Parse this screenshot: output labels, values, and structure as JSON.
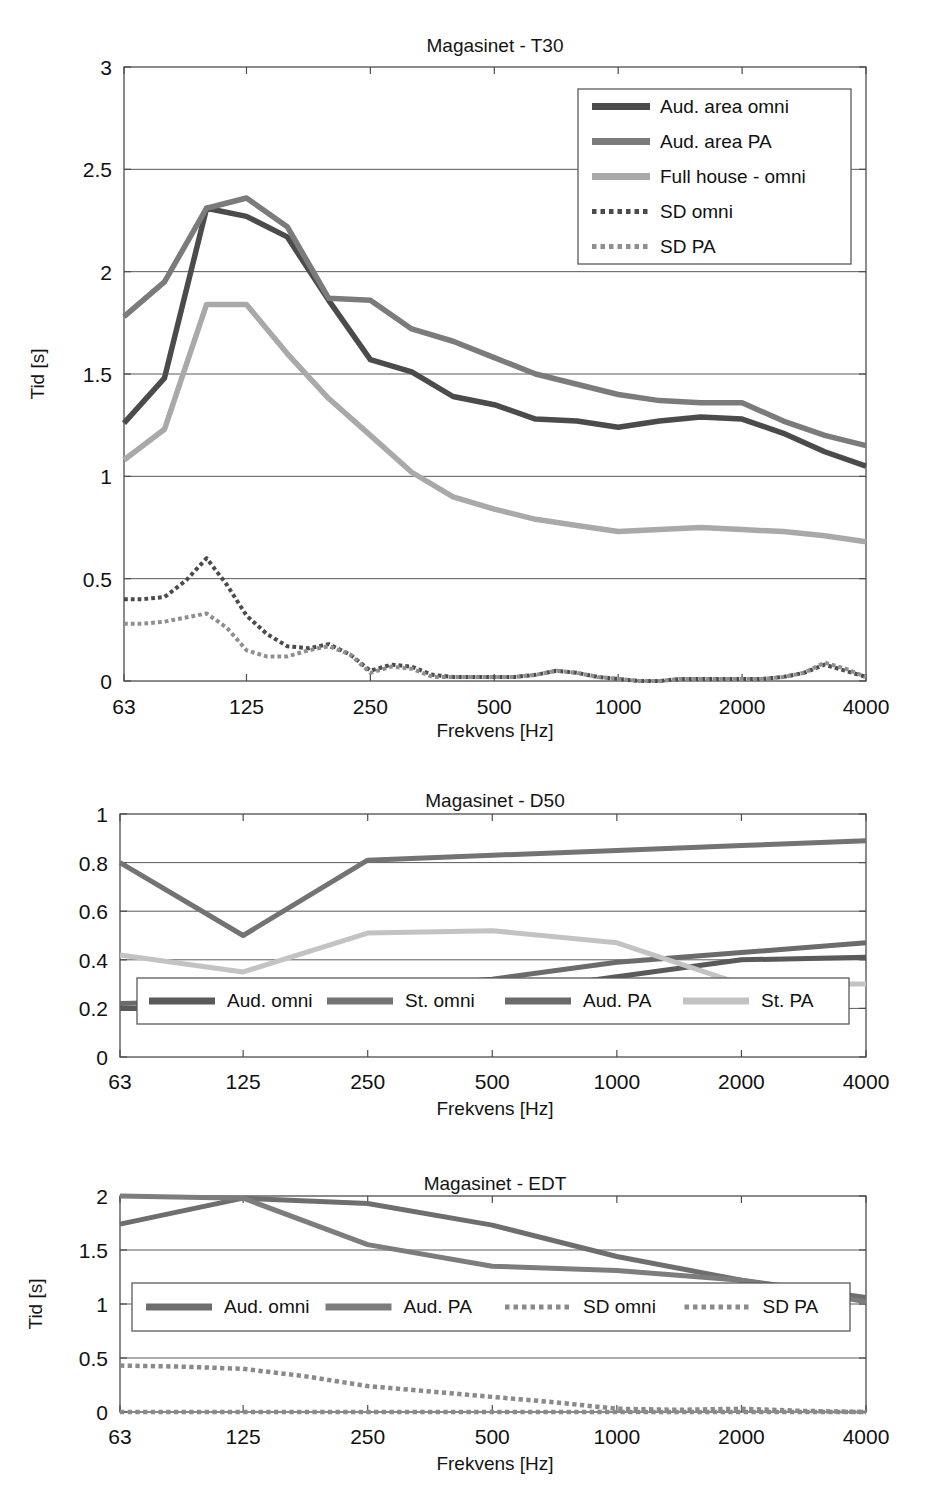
{
  "figure": {
    "x_tick_labels": [
      "63",
      "125",
      "250",
      "500",
      "1000",
      "2000",
      "4000"
    ],
    "xlabel": "Frekvens [Hz]",
    "ylabel_time": "Tid [s]"
  },
  "chart_data": [
    {
      "id": "t30",
      "type": "line",
      "title": "Magasinet - T30",
      "xlabel": "Frekvens [Hz]",
      "ylabel": "Tid [s]",
      "xscale": "log",
      "x_ticks": [
        63,
        125,
        250,
        500,
        1000,
        2000,
        4000
      ],
      "x_tick_labels": [
        "63",
        "125",
        "250",
        "500",
        "1000",
        "2000",
        "4000"
      ],
      "xlim": [
        63,
        4000
      ],
      "ylim": [
        0,
        3
      ],
      "y_ticks": [
        0,
        0.5,
        1,
        1.5,
        2,
        2.5,
        3
      ],
      "y_tick_labels": [
        "0",
        "0.5",
        "1",
        "1.5",
        "2",
        "2.5",
        "3"
      ],
      "grid": true,
      "legend_position": "top-right",
      "series": [
        {
          "name": "Aud. area omni",
          "color": "#4b4b4b",
          "style": "solid",
          "width": 5.5,
          "x": [
            63,
            79,
            100,
            125,
            157,
            198,
            250,
            315,
            397,
            500,
            630,
            794,
            1000,
            1260,
            1587,
            2000,
            2520,
            3175,
            4000
          ],
          "values": [
            1.26,
            1.48,
            2.31,
            2.27,
            2.17,
            1.86,
            1.57,
            1.51,
            1.39,
            1.35,
            1.28,
            1.27,
            1.24,
            1.27,
            1.29,
            1.28,
            1.21,
            1.12,
            1.05
          ]
        },
        {
          "name": "Aud. area PA",
          "color": "#7b7b7b",
          "style": "solid",
          "width": 5.5,
          "x": [
            63,
            79,
            100,
            125,
            157,
            198,
            250,
            315,
            397,
            500,
            630,
            794,
            1000,
            1260,
            1587,
            2000,
            2520,
            3175,
            4000
          ],
          "values": [
            1.78,
            1.95,
            2.31,
            2.36,
            2.22,
            1.87,
            1.86,
            1.72,
            1.66,
            1.58,
            1.5,
            1.45,
            1.4,
            1.37,
            1.36,
            1.36,
            1.27,
            1.2,
            1.15
          ]
        },
        {
          "name": "Full house - omni",
          "color": "#a9a9a9",
          "style": "solid",
          "width": 5.5,
          "x": [
            63,
            79,
            100,
            125,
            157,
            198,
            250,
            315,
            397,
            500,
            630,
            794,
            1000,
            1260,
            1587,
            2000,
            2520,
            3175,
            4000
          ],
          "values": [
            1.08,
            1.23,
            1.84,
            1.84,
            1.6,
            1.38,
            1.2,
            1.02,
            0.9,
            0.84,
            0.79,
            0.76,
            0.73,
            0.74,
            0.75,
            0.74,
            0.73,
            0.71,
            0.68
          ]
        },
        {
          "name": "SD omni",
          "color": "#4b4b4b",
          "style": "dotted",
          "width": 4,
          "x": [
            63,
            70,
            79,
            89,
            100,
            112,
            125,
            140,
            157,
            177,
            198,
            223,
            250,
            281,
            315,
            354,
            397,
            445,
            500,
            561,
            630,
            707,
            794,
            891,
            1000,
            1122,
            1260,
            1414,
            1587,
            1782,
            2000,
            2245,
            2520,
            2828,
            3175,
            3564,
            4000
          ],
          "values": [
            0.4,
            0.4,
            0.41,
            0.49,
            0.6,
            0.47,
            0.32,
            0.23,
            0.17,
            0.16,
            0.18,
            0.13,
            0.05,
            0.08,
            0.07,
            0.03,
            0.02,
            0.02,
            0.02,
            0.02,
            0.03,
            0.05,
            0.04,
            0.02,
            0.01,
            0.0,
            0.0,
            0.01,
            0.01,
            0.01,
            0.01,
            0.01,
            0.02,
            0.04,
            0.08,
            0.05,
            0.02
          ]
        },
        {
          "name": "SD PA",
          "color": "#8f8f8f",
          "style": "dotted",
          "width": 4,
          "x": [
            63,
            70,
            79,
            89,
            100,
            112,
            125,
            140,
            157,
            177,
            198,
            223,
            250,
            281,
            315,
            354,
            397,
            445,
            500,
            561,
            630,
            707,
            794,
            891,
            1000,
            1122,
            1260,
            1414,
            1587,
            1782,
            2000,
            2245,
            2520,
            2828,
            3175,
            3564,
            4000
          ],
          "values": [
            0.28,
            0.28,
            0.29,
            0.31,
            0.33,
            0.26,
            0.15,
            0.12,
            0.12,
            0.15,
            0.17,
            0.13,
            0.04,
            0.07,
            0.06,
            0.02,
            0.02,
            0.02,
            0.02,
            0.02,
            0.03,
            0.05,
            0.04,
            0.02,
            0.01,
            0.0,
            0.0,
            0.01,
            0.01,
            0.01,
            0.01,
            0.01,
            0.02,
            0.04,
            0.09,
            0.06,
            0.02
          ]
        }
      ]
    },
    {
      "id": "d50",
      "type": "line",
      "title": "Magasinet - D50",
      "xlabel": "Frekvens [Hz]",
      "ylabel": "",
      "xscale": "log",
      "x_ticks": [
        63,
        125,
        250,
        500,
        1000,
        2000,
        4000
      ],
      "x_tick_labels": [
        "63",
        "125",
        "250",
        "500",
        "1000",
        "2000",
        "4000"
      ],
      "xlim": [
        63,
        4000
      ],
      "ylim": [
        0,
        1
      ],
      "y_ticks": [
        0,
        0.2,
        0.4,
        0.6,
        0.8,
        1
      ],
      "y_tick_labels": [
        "0",
        "0.2",
        "0.4",
        "0.6",
        "0.8",
        "1"
      ],
      "grid": true,
      "legend_position": "bottom-inside",
      "series": [
        {
          "name": "Aud. omni",
          "color": "#5a5a5a",
          "style": "solid",
          "width": 5,
          "x": [
            63,
            125,
            250,
            500,
            1000,
            2000,
            4000
          ],
          "values": [
            0.2,
            0.2,
            0.25,
            0.26,
            0.33,
            0.4,
            0.41
          ]
        },
        {
          "name": "St. omni",
          "color": "#737373",
          "style": "solid",
          "width": 5,
          "x": [
            63,
            125,
            250,
            500,
            1000,
            2000,
            4000
          ],
          "values": [
            0.8,
            0.5,
            0.81,
            0.83,
            0.85,
            0.87,
            0.89
          ]
        },
        {
          "name": "Aud. PA",
          "color": "#6b6b6b",
          "style": "solid",
          "width": 5,
          "x": [
            63,
            125,
            250,
            500,
            1000,
            2000,
            4000
          ],
          "values": [
            0.22,
            0.23,
            0.28,
            0.32,
            0.39,
            0.43,
            0.47
          ]
        },
        {
          "name": "St. PA",
          "color": "#c3c3c3",
          "style": "solid",
          "width": 5,
          "x": [
            63,
            125,
            250,
            500,
            1000,
            2000,
            4000
          ],
          "values": [
            0.42,
            0.35,
            0.51,
            0.52,
            0.47,
            0.3,
            0.3
          ]
        }
      ]
    },
    {
      "id": "edt",
      "type": "line",
      "title": "Magasinet - EDT",
      "xlabel": "Frekvens [Hz]",
      "ylabel": "Tid [s]",
      "xscale": "log",
      "x_ticks": [
        63,
        125,
        250,
        500,
        1000,
        2000,
        4000
      ],
      "x_tick_labels": [
        "63",
        "125",
        "250",
        "500",
        "1000",
        "2000",
        "4000"
      ],
      "xlim": [
        63,
        4000
      ],
      "ylim": [
        0,
        2
      ],
      "y_ticks": [
        0,
        0.5,
        1,
        1.5,
        2
      ],
      "y_tick_labels": [
        "0",
        "0.5",
        "1",
        "1.5",
        "2"
      ],
      "grid": true,
      "legend_position": "middle-inside",
      "series": [
        {
          "name": "Aud. omni",
          "color": "#6e6e6e",
          "style": "solid",
          "width": 5,
          "x": [
            63,
            125,
            250,
            500,
            1000,
            2000,
            4000
          ],
          "values": [
            1.74,
            1.98,
            1.93,
            1.73,
            1.44,
            1.22,
            1.06
          ]
        },
        {
          "name": "Aud. PA",
          "color": "#7d7d7d",
          "style": "solid",
          "width": 5,
          "x": [
            63,
            125,
            250,
            500,
            1000,
            2000,
            4000
          ],
          "values": [
            2.0,
            1.98,
            1.55,
            1.35,
            1.31,
            1.22,
            1.02
          ]
        },
        {
          "name": "SD omni",
          "color": "#8a8a8a",
          "style": "dotted",
          "width": 4.5,
          "x": [
            63,
            89,
            125,
            177,
            250,
            354,
            500,
            707,
            1000,
            1414,
            2000,
            2828,
            4000
          ],
          "values": [
            0.43,
            0.42,
            0.4,
            0.33,
            0.24,
            0.19,
            0.14,
            0.09,
            0.03,
            0.02,
            0.03,
            0.01,
            -0.02
          ]
        },
        {
          "name": "SD PA",
          "color": "#8a8a8a",
          "style": "dotted",
          "width": 4.5,
          "x": [
            63,
            125,
            250,
            500,
            1000,
            2000,
            4000
          ],
          "values": [
            0.0,
            0.0,
            0.0,
            0.0,
            0.0,
            0.0,
            0.0
          ]
        }
      ]
    }
  ]
}
